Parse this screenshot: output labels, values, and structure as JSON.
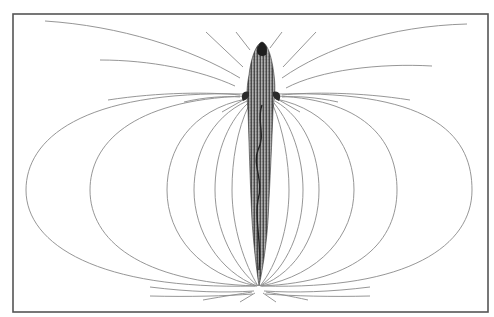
{
  "figure": {
    "title": "Electric field lines around an electric fish",
    "colors": {
      "background": "#ffffff",
      "frame": "#555555",
      "field_lines": "#8a8a8a",
      "fish_dark": "#2a2a2a",
      "fish_mid": "#6a6a6a"
    },
    "frame": {
      "x": 13,
      "y": 14,
      "width": 475,
      "height": 298
    },
    "fish": {
      "head_tip": [
        262,
        42
      ],
      "pectoral_fins_y": 96,
      "tail_tip": [
        259,
        286
      ]
    },
    "field_loops_left_extents_x": [
      26,
      90,
      167,
      194,
      215,
      232
    ],
    "field_loops_right_extents_x": [
      472,
      397,
      354,
      319,
      303,
      289
    ],
    "top_curves": [
      {
        "side": "left",
        "from": [
          45,
          21
        ],
        "to": [
          238,
          78
        ]
      },
      {
        "side": "left",
        "from": [
          100,
          60
        ],
        "to": [
          233,
          86
        ]
      },
      {
        "side": "right",
        "from": [
          467,
          24
        ],
        "to": [
          283,
          78
        ]
      },
      {
        "side": "right",
        "from": [
          432,
          66
        ],
        "to": [
          286,
          88
        ]
      }
    ]
  }
}
